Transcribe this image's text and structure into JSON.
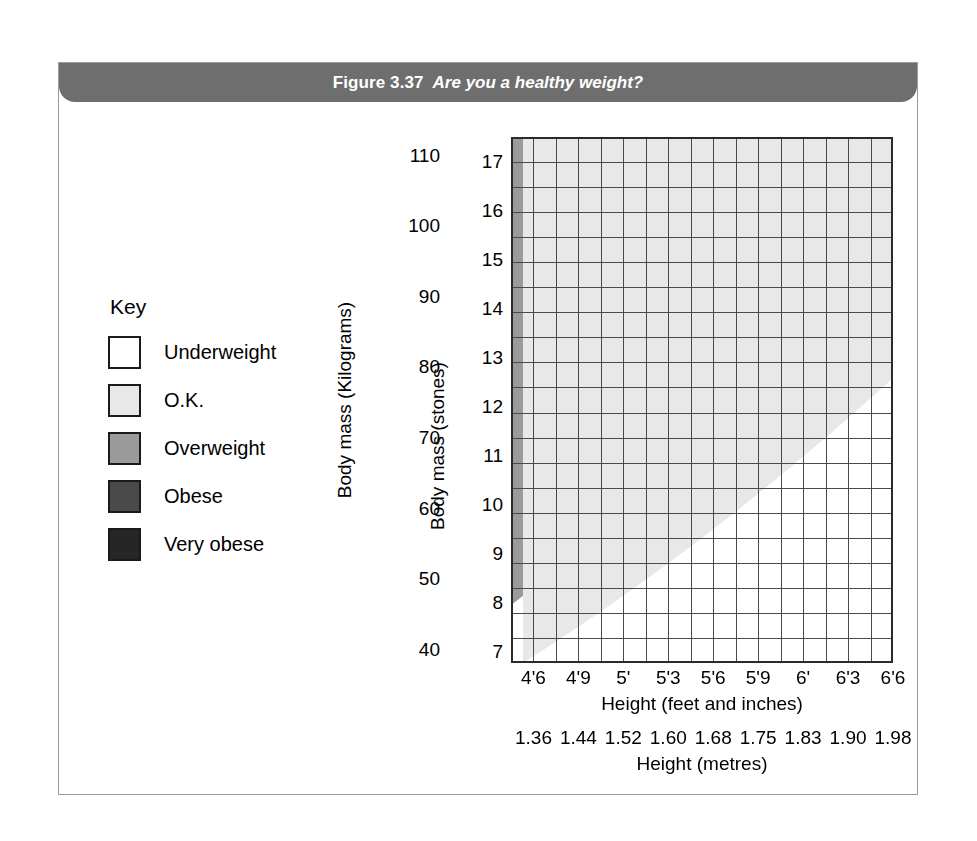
{
  "figure": {
    "number": "Figure 3.37",
    "title": "Are you a healthy weight?"
  },
  "key": {
    "heading": "Key",
    "items": [
      {
        "label": "Underweight",
        "color": "#ffffff"
      },
      {
        "label": "O.K.",
        "color": "#e8e8e8"
      },
      {
        "label": "Overweight",
        "color": "#9b9b9b"
      },
      {
        "label": "Obese",
        "color": "#4a4a4a"
      },
      {
        "label": "Very obese",
        "color": "#262626"
      }
    ]
  },
  "chart_data": {
    "type": "heatmap",
    "title": "Are you a healthy weight?",
    "xlabel": "Height (feet and inches)",
    "xlabel2": "Height (metres)",
    "ylabel": "Body mass (Kilograms)",
    "ylabel2": "Body mass (stones)",
    "grid": true,
    "legend_position": "left",
    "x_ticks_feet": [
      "4'6",
      "4'9",
      "5'",
      "5'3",
      "5'6",
      "5'9",
      "6'",
      "6'3",
      "6'6"
    ],
    "x_ticks_metres": [
      "1.36",
      "1.44",
      "1.52",
      "1.60",
      "1.68",
      "1.75",
      "1.83",
      "1.90",
      "1.98"
    ],
    "y_ticks_kg": [
      "110",
      "100",
      "90",
      "80",
      "70",
      "60",
      "50",
      "40"
    ],
    "y_ticks_stones": [
      "17",
      "16",
      "15",
      "14",
      "13",
      "12",
      "11",
      "10",
      "9",
      "8",
      "7"
    ],
    "xlim_metres": [
      1.36,
      1.98
    ],
    "ylim_kg": [
      38.0,
      112.5
    ],
    "ylim_stones": [
      6.75,
      17.5
    ],
    "grid_columns": 17,
    "grid_rows": 21,
    "categories": [
      "Underweight",
      "O.K.",
      "Overweight",
      "Obese",
      "Very obese"
    ],
    "bmi_band_thresholds": [
      20,
      25,
      30,
      40
    ],
    "series": [
      {
        "name": "Underweight",
        "bmi_range": "below 20",
        "color": "#ffffff"
      },
      {
        "name": "O.K.",
        "bmi_range": "20 to 25",
        "color": "#e8e8e8"
      },
      {
        "name": "Overweight",
        "bmi_range": "25 to 30",
        "color": "#9b9b9b"
      },
      {
        "name": "Obese",
        "bmi_range": "30 to 40",
        "color": "#4a4a4a"
      },
      {
        "name": "Very obese",
        "bmi_range": "above 40",
        "color": "#262626"
      }
    ]
  }
}
